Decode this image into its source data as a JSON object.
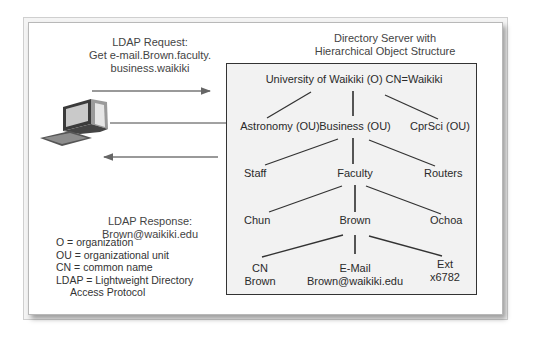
{
  "diagram": {
    "server_title": [
      "Directory Server with",
      "Hierarchical Object Structure"
    ],
    "request": {
      "label": [
        "LDAP Request:",
        "Get e-mail.Brown.faculty.",
        "business.waikiki"
      ]
    },
    "response": {
      "label": [
        "LDAP Response:",
        "Brown@waikiki.edu"
      ]
    },
    "client_icon": "desktop-computer-icon",
    "tree": {
      "root": "University of Waikiki (O) CN=Waikiki",
      "level1": [
        "Astronomy (OU)",
        "Business (OU)",
        "CprSci (OU)"
      ],
      "level2": [
        "Staff",
        "Faculty",
        "Routers"
      ],
      "level3": [
        "Chun",
        "Brown",
        "Ochoa"
      ],
      "level4": [
        {
          "line1": "CN",
          "line2": "Brown"
        },
        {
          "line1": "E-Mail",
          "line2": "Brown@waikiki.edu"
        },
        {
          "line1": "Ext",
          "line2": "x6782"
        }
      ]
    },
    "legend": [
      "O = organization",
      "OU = organizational unit",
      "CN = common name",
      "LDAP = Lightweight Directory",
      "Access Protocol"
    ],
    "colors": {
      "arrow": "#555555",
      "server_box_bg": "#f2f2f2",
      "server_box_border": "#333333",
      "tree_line": "#333333"
    }
  }
}
